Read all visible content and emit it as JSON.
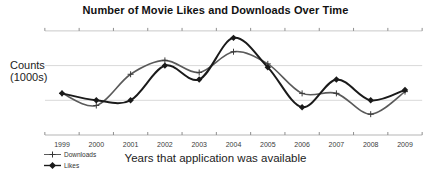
{
  "title": "Number of Movie Likes and Downloads Over Time",
  "y_axis": {
    "label_line1": "Counts",
    "label_line2": "(1000s)"
  },
  "x_axis": {
    "label": "Years that application was available"
  },
  "legend": [
    {
      "label": "Downloads",
      "marker": "plus"
    },
    {
      "label": "Likes",
      "marker": "diamond"
    }
  ],
  "colors": {
    "downloads_line": "#5a5a5a",
    "likes_line": "#1a1a1a",
    "gridline": "#d9d9d9",
    "top_border": "#c9c9c9",
    "axis_line": "#b5b5b5",
    "tick": "#8f8f8f",
    "tick_label": "#3a3a3a"
  },
  "chart_data": {
    "type": "line",
    "title": "Number of Movie Likes and Downloads Over Time",
    "xlabel": "Years that application was available",
    "ylabel": "Counts (1000s)",
    "categories": [
      "1999",
      "2000",
      "2001",
      "2002",
      "2003",
      "2004",
      "2005",
      "2006",
      "2007",
      "2008",
      "2009"
    ],
    "series": [
      {
        "name": "Downloads",
        "marker": "plus",
        "color": "#5a5a5a",
        "values": [
          1.2,
          0.85,
          1.75,
          2.15,
          1.8,
          2.4,
          2.05,
          1.2,
          1.2,
          0.6,
          1.25
        ]
      },
      {
        "name": "Likes",
        "marker": "diamond",
        "color": "#1a1a1a",
        "values": [
          1.2,
          1.0,
          1.0,
          2.0,
          1.6,
          2.8,
          1.95,
          0.8,
          1.6,
          1.0,
          1.3
        ]
      }
    ],
    "ylim": [
      0,
      3
    ],
    "y_tick_labels_visible": false,
    "grid": "horizontal",
    "smooth": true,
    "legend_position": "bottom-left"
  }
}
